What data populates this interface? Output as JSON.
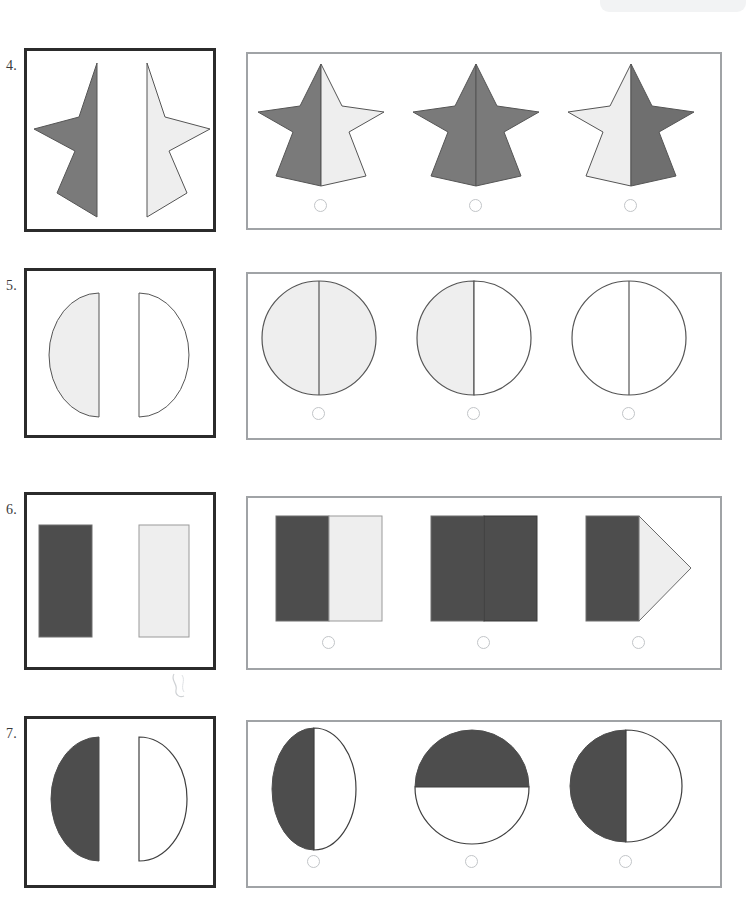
{
  "page": {
    "width": 754,
    "height": 901,
    "background": "#ffffff",
    "kind": "shape-matching worksheet"
  },
  "colors": {
    "dark_fill": "#4d4d4d",
    "medium_fill": "#7a7a7a",
    "light_fill": "#eeeeee",
    "white_fill": "#ffffff",
    "shape_outline": "#555555",
    "prompt_border": "#2b2b2b",
    "panel_border": "#a0a3a6",
    "radio_border": "#c2c5c8",
    "number_text": "#3a3a3a"
  },
  "items": [
    {
      "number": "4.",
      "shape_kind": "star",
      "prompt": {
        "left_half": {
          "name": "star-left-half",
          "fill": "#7a7a7a"
        },
        "right_half": {
          "name": "star-right-half",
          "fill": "#eeeeee"
        }
      },
      "options": [
        {
          "id": "a",
          "description": "star with gray left half and light right half",
          "left_fill": "#7a7a7a",
          "right_fill": "#eeeeee",
          "selected": false
        },
        {
          "id": "b",
          "description": "fully gray star with center divider",
          "left_fill": "#7a7a7a",
          "right_fill": "#7a7a7a",
          "selected": false
        },
        {
          "id": "c",
          "description": "star with light left half and gray right half",
          "left_fill": "#eeeeee",
          "right_fill": "#7a7a7a",
          "selected": false
        }
      ]
    },
    {
      "number": "5.",
      "shape_kind": "circle",
      "prompt": {
        "left_half": {
          "name": "semicircle-left-half",
          "fill": "#eeeeee"
        },
        "right_half": {
          "name": "semicircle-right-half",
          "fill": "#ffffff"
        }
      },
      "options": [
        {
          "id": "a",
          "description": "fully light gray circle with vertical divider",
          "left_fill": "#eeeeee",
          "right_fill": "#eeeeee",
          "selected": false
        },
        {
          "id": "b",
          "description": "circle with light gray left half and white right half",
          "left_fill": "#eeeeee",
          "right_fill": "#ffffff",
          "selected": false
        },
        {
          "id": "c",
          "description": "fully white circle with vertical divider",
          "left_fill": "#ffffff",
          "right_fill": "#ffffff",
          "selected": false
        }
      ]
    },
    {
      "number": "6.",
      "shape_kind": "rectangle",
      "prompt": {
        "left_half": {
          "name": "rectangle-dark",
          "fill": "#4d4d4d"
        },
        "right_half": {
          "name": "rectangle-light",
          "fill": "#eeeeee"
        }
      },
      "options": [
        {
          "id": "a",
          "description": "square with dark left half and light right half",
          "left_fill": "#4d4d4d",
          "right_fill": "#eeeeee",
          "selected": false
        },
        {
          "id": "b",
          "description": "fully dark square with vertical divider",
          "left_fill": "#4d4d4d",
          "right_fill": "#4d4d4d",
          "selected": false
        },
        {
          "id": "c",
          "description": "dark rectangle with light triangle pointing right",
          "left_fill": "#4d4d4d",
          "right_fill": "#eeeeee",
          "variant": "arrow",
          "selected": false
        }
      ]
    },
    {
      "number": "7.",
      "shape_kind": "circle",
      "prompt": {
        "left_half": {
          "name": "semicircle-left-dark",
          "fill": "#4d4d4d"
        },
        "right_half": {
          "name": "semicircle-right-white",
          "fill": "#ffffff"
        }
      },
      "options": [
        {
          "id": "a",
          "description": "tall ellipse with dark left half and white right half",
          "left_fill": "#4d4d4d",
          "right_fill": "#ffffff",
          "variant": "ellipse",
          "selected": false
        },
        {
          "id": "b",
          "description": "circle with dark top half and white bottom half",
          "left_fill": "#4d4d4d",
          "right_fill": "#ffffff",
          "variant": "horizontal",
          "selected": false
        },
        {
          "id": "c",
          "description": "circle with dark left half and white right half",
          "left_fill": "#4d4d4d",
          "right_fill": "#ffffff",
          "selected": false
        }
      ]
    }
  ]
}
